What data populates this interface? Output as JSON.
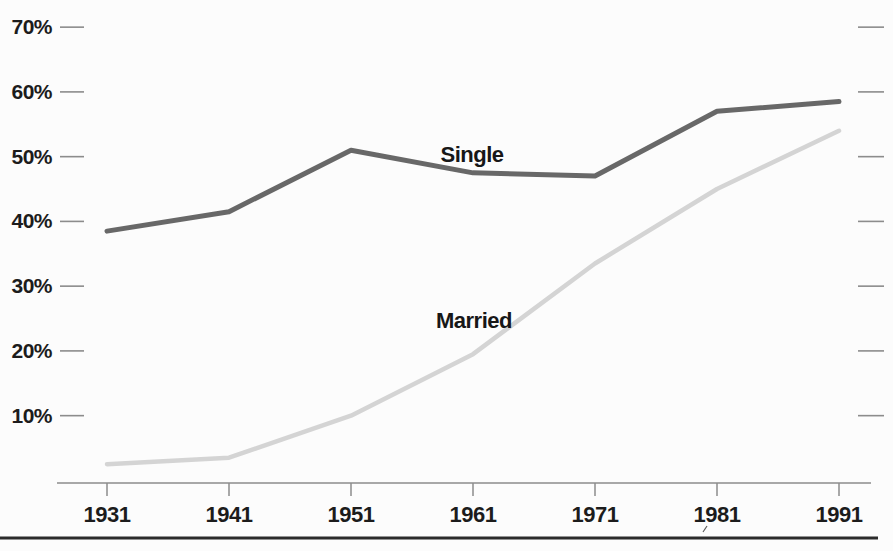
{
  "page": {
    "background": "#fcfcfc"
  },
  "chart_data": {
    "type": "line",
    "title": "",
    "subtitle": "",
    "xlabel": "",
    "ylabel": "",
    "x": [
      1931,
      1941,
      1951,
      1961,
      1971,
      1981,
      1991
    ],
    "x_tick_labels": [
      "1931",
      "1941",
      "1951",
      "1961",
      "1971",
      "1981",
      "1991"
    ],
    "y_ticks": [
      70,
      60,
      50,
      40,
      30,
      20,
      10
    ],
    "y_tick_labels": [
      "70%",
      "60%",
      "50%",
      "40%",
      "30%",
      "20%",
      "10%"
    ],
    "ylim": [
      0,
      74
    ],
    "grid": false,
    "legend_position": "inline-labels-on-lines",
    "tick_style": "short-dashes-left-and-right",
    "axis_color": "#8c8c8c",
    "text_color": "#1c1c1c",
    "series": [
      {
        "name": "Single",
        "values": [
          38.5,
          41.5,
          51,
          47.5,
          47,
          57,
          58.5
        ],
        "color": "#686868",
        "stroke_width": 5
      },
      {
        "name": "Married",
        "values": [
          2.5,
          3.5,
          10,
          19.5,
          33.5,
          45,
          54
        ],
        "color": "#d4d4d4",
        "stroke_width": 4.5
      }
    ]
  },
  "divider": {
    "color": "#2b2b2b"
  }
}
